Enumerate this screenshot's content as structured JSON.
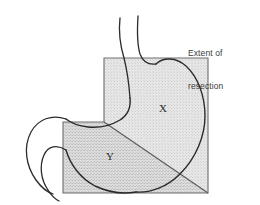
{
  "figure": {
    "caption": {
      "line1": "Extent of",
      "line2": "resection",
      "full_text": "Extent of resection"
    },
    "zones": [
      {
        "id": "x",
        "label": "X",
        "shade": "light",
        "description": "upper resection zone"
      },
      {
        "id": "y",
        "label": "Y",
        "shade": "dark",
        "description": "lower resection zone"
      }
    ],
    "colors": {
      "background": "#ffffff",
      "outline": "#2b2b2b",
      "zone_light_fill": "#e3e3e3",
      "zone_dark_fill": "#d0d0d0",
      "box_stroke": "#6e6e6e",
      "caption_text": "#3a3a3a",
      "label_text": "#2b2b2b"
    },
    "anatomy": [
      {
        "id": "esophagus",
        "label": "esophagus"
      },
      {
        "id": "fundus",
        "label": "fundus"
      },
      {
        "id": "greater-curvature",
        "label": "greater curvature"
      },
      {
        "id": "lesser-curvature",
        "label": "lesser curvature"
      },
      {
        "id": "antrum",
        "label": "antrum"
      },
      {
        "id": "duodenum",
        "label": "duodenum"
      }
    ]
  }
}
